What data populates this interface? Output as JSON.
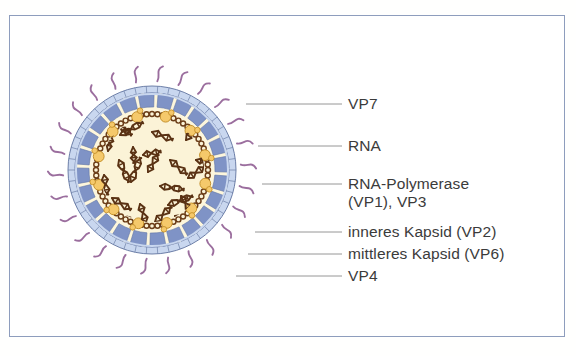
{
  "figure": {
    "language": "de",
    "background_color": "#ffffff",
    "frame_color": "#8e9dbd"
  },
  "labels": [
    {
      "id": "vp7",
      "text": "VP7",
      "y": 104,
      "line_from_x": 246,
      "line_to_x": 342,
      "text_x": 348,
      "text_y": 95
    },
    {
      "id": "rna",
      "text": "RNA",
      "y": 146,
      "line_from_x": 258,
      "line_to_x": 342,
      "text_x": 348,
      "text_y": 137
    },
    {
      "id": "rna-pol",
      "text": "RNA-Polymerase",
      "y": 184,
      "line_from_x": 262,
      "line_to_x": 342,
      "text_x": 348,
      "text_y": 175
    },
    {
      "id": "rna-pol-2",
      "text": "(VP1), VP3",
      "y": null,
      "line_from_x": null,
      "line_to_x": null,
      "text_x": 348,
      "text_y": 193
    },
    {
      "id": "kapsid-in",
      "text": "inneres Kapsid (VP2)",
      "y": 232,
      "line_from_x": 255,
      "line_to_x": 342,
      "text_x": 348,
      "text_y": 223
    },
    {
      "id": "kapsid-mid",
      "text": "mittleres Kapsid (VP6)",
      "y": 254,
      "line_from_x": 248,
      "line_to_x": 342,
      "text_x": 348,
      "text_y": 245
    },
    {
      "id": "vp4",
      "text": "VP4",
      "y": 276,
      "line_from_x": 236,
      "line_to_x": 342,
      "text_x": 348,
      "text_y": 267
    }
  ],
  "virus": {
    "center_x": 152,
    "center_y": 170,
    "outer_ring_radius": 88,
    "middle_capsid_radius": 74,
    "inner_capsid_radius": 58,
    "core_radius": 52,
    "spike_count": 26,
    "colors": {
      "vp7_ring": "#c9d7ef",
      "vp7_ring_line": "#6d7fa8",
      "vp6_block_outer": "#b9c8e6",
      "vp6_block_inner": "#7f93c6",
      "wedge": "#fdf6dc",
      "core": "#fbf3d7",
      "rna": "#5a3214",
      "polymerase": "#f5c96b",
      "polymerase_edge": "#c08a22",
      "spike": "#9b6e9e",
      "bead_chain": "#6b3d18"
    },
    "rna_segment_count": 22,
    "polymerase_count": 12
  }
}
